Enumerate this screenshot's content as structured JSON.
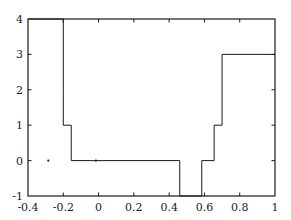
{
  "chart_data": {
    "type": "line",
    "title": "",
    "xlabel": "",
    "ylabel": "",
    "xlim": [
      -0.4,
      1.0
    ],
    "ylim": [
      -1,
      4
    ],
    "grid": false,
    "legend": null,
    "drawstyle": "steps-post",
    "line_color": "#1a1a1a",
    "line_width": 1,
    "xticks": [
      -0.4,
      -0.2,
      0,
      0.2,
      0.4,
      0.6,
      0.8,
      1
    ],
    "xtick_labels": [
      "-0.4",
      "-0.2",
      "0",
      "0.2",
      "0.4",
      "0.6",
      "0.8",
      "1"
    ],
    "yticks": [
      -1,
      0,
      1,
      2,
      3,
      4
    ],
    "ytick_labels": [
      "-1",
      "0",
      "1",
      "2",
      "3",
      "4"
    ],
    "x": [
      -0.4,
      -0.2,
      -0.2,
      -0.2,
      -0.155,
      -0.155,
      0.46,
      0.46,
      0.585,
      0.585,
      0.655,
      0.655,
      0.7,
      0.7,
      1.0
    ],
    "y": [
      4,
      4,
      2,
      1,
      1,
      0,
      0,
      -1,
      -1,
      0,
      0,
      1,
      1,
      3,
      3
    ],
    "steps": [
      {
        "x_start": -0.4,
        "x_end": -0.2,
        "value": 4
      },
      {
        "x_start": -0.2,
        "x_end": -0.2,
        "value": 2
      },
      {
        "x_start": -0.2,
        "x_end": -0.155,
        "value": 1
      },
      {
        "x_start": -0.155,
        "x_end": 0.46,
        "value": 0
      },
      {
        "x_start": 0.46,
        "x_end": 0.585,
        "value": -1
      },
      {
        "x_start": 0.585,
        "x_end": 0.655,
        "value": 0
      },
      {
        "x_start": 0.655,
        "x_end": 0.7,
        "value": 1
      },
      {
        "x_start": 0.7,
        "x_end": 1.0,
        "value": 3
      }
    ],
    "series": [
      {
        "name": "step",
        "points": [
          {
            "x": -0.4,
            "y": 4
          },
          {
            "x": -0.2,
            "y": 4
          },
          {
            "x": -0.2,
            "y": 2
          },
          {
            "x": -0.2,
            "y": 1
          },
          {
            "x": -0.155,
            "y": 1
          },
          {
            "x": -0.155,
            "y": 0
          },
          {
            "x": 0.46,
            "y": 0
          },
          {
            "x": 0.46,
            "y": -1
          },
          {
            "x": 0.585,
            "y": -1
          },
          {
            "x": 0.585,
            "y": 0
          },
          {
            "x": 0.655,
            "y": 0
          },
          {
            "x": 0.655,
            "y": 1
          },
          {
            "x": 0.7,
            "y": 1
          },
          {
            "x": 0.7,
            "y": 3
          },
          {
            "x": 1.0,
            "y": 3
          }
        ]
      }
    ],
    "markers": [
      {
        "x": -0.285,
        "y": 0
      },
      {
        "x": -0.015,
        "y": 0
      }
    ],
    "frame_color": "#1a1a1a",
    "background": "#ffffff"
  }
}
